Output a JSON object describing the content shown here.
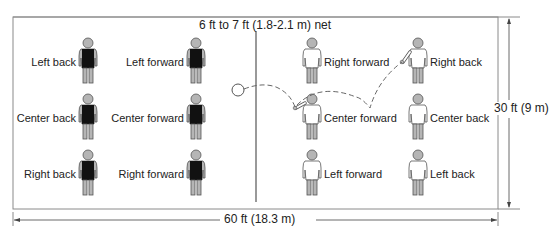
{
  "diagram": {
    "net_label": "6 ft to 7 ft (1.8-2.1 m) net",
    "width_label": "30 ft (9 m)",
    "length_label": "60 ft (18.3 m)",
    "colors": {
      "court_line": "#8a8a8a",
      "net_line": "#555555",
      "team_a_shirt": "#111111",
      "team_b_shirt": "#ffffff",
      "figure_gray": "#b5b5b5",
      "figure_outline": "#555555"
    },
    "team_left": {
      "shirt": "dark",
      "players": [
        {
          "label": "Left back"
        },
        {
          "label": "Left forward"
        },
        {
          "label": "Center back"
        },
        {
          "label": "Center forward"
        },
        {
          "label": "Right back"
        },
        {
          "label": "Right forward"
        }
      ]
    },
    "team_right": {
      "shirt": "light",
      "players": [
        {
          "label": "Right forward"
        },
        {
          "label": "Right back"
        },
        {
          "label": "Center forward"
        },
        {
          "label": "Center back"
        },
        {
          "label": "Left forward"
        },
        {
          "label": "Left back"
        }
      ]
    },
    "ball": {
      "shape": "circle"
    },
    "pass_path": {
      "style": "dashed",
      "description": "ball passes from Right back to Center forward, then over the net"
    }
  }
}
